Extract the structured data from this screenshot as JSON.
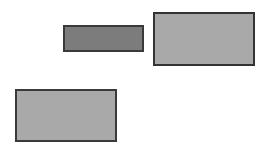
{
  "canvas": {
    "width": 266,
    "height": 152,
    "background": "#ffffff"
  },
  "shapes": [
    {
      "id": "rect-dark",
      "x": 63,
      "y": 25,
      "w": 81,
      "h": 27,
      "fill": "#7c7c7c",
      "border": "#3a3a3a",
      "border_width": 2
    },
    {
      "id": "rect-top-right",
      "x": 153,
      "y": 12,
      "w": 102,
      "h": 54,
      "fill": "#a9a9a9",
      "border": "#333333",
      "border_width": 2
    },
    {
      "id": "rect-bottom-left",
      "x": 15,
      "y": 89,
      "w": 102,
      "h": 53,
      "fill": "#a9a9a9",
      "border": "#3a3a3a",
      "border_width": 2
    }
  ]
}
